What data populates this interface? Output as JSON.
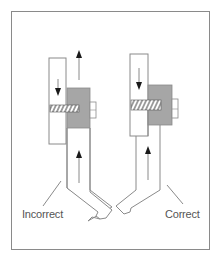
{
  "figure": {
    "labels": {
      "incorrect": "Incorrect",
      "correct": "Correct"
    },
    "colors": {
      "line": "#8a8a8a",
      "block_fill": "#a6a6a6",
      "arrow": "#1a1a1a",
      "background": "#ffffff"
    },
    "panels": [
      {
        "id": "incorrect",
        "label": "Incorrect",
        "upper_arrow": "down",
        "lower_arrow": "up",
        "outer_arrow": "up"
      },
      {
        "id": "correct",
        "label": "Correct",
        "upper_arrow": "down",
        "lower_arrow": "up"
      }
    ]
  }
}
